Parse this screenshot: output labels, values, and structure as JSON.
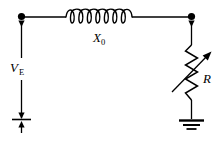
{
  "figure": {
    "background_color": "#ffffff",
    "line_color": "#000000",
    "width": 223,
    "height": 144
  },
  "labels": {
    "source": {
      "symbol": "V",
      "subscript": "E",
      "name": "source-voltage-label"
    },
    "reactance": {
      "symbol": "X",
      "subscript": "0",
      "name": "reactance-label"
    },
    "resistor": {
      "symbol": "R",
      "subscript": "",
      "name": "resistance-label"
    }
  },
  "components": [
    {
      "id": "voltage-source",
      "type": "voltage-source-arrow",
      "label": "V_E",
      "orientation": "vertical",
      "position": "left-branch"
    },
    {
      "id": "inductor",
      "type": "inductor-coil",
      "label": "X_0",
      "coil_turns": 8,
      "orientation": "horizontal",
      "position": "top-branch"
    },
    {
      "id": "variable-resistor",
      "type": "variable-resistor",
      "label": "R",
      "zigzag_segments": 8,
      "has_arrow": true,
      "orientation": "vertical",
      "position": "right-branch"
    },
    {
      "id": "ground",
      "type": "earth-ground",
      "bars": 3,
      "position": "bottom-right"
    }
  ],
  "nodes": [
    {
      "id": "node-left",
      "type": "junction-dot"
    },
    {
      "id": "node-right",
      "type": "junction-dot"
    }
  ]
}
